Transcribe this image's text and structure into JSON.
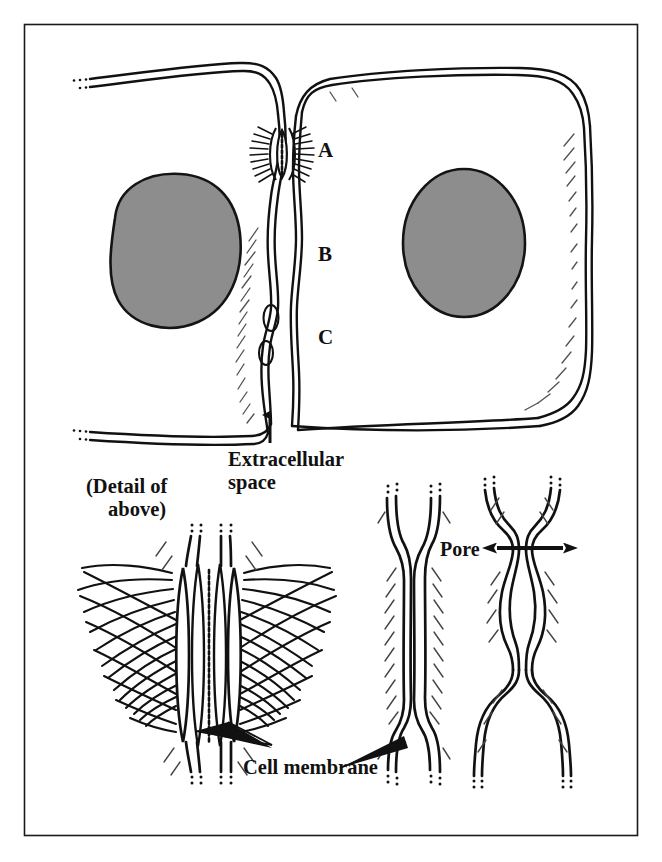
{
  "figure": {
    "frame_color": "#1a1a1a",
    "background_color": "#ffffff",
    "ink_color": "#111111",
    "nucleus_fill": "#8d8d8d",
    "nucleus_stroke": "#141414"
  },
  "labels": {
    "junction_a": "A",
    "junction_b": "B",
    "junction_c": "C",
    "extracellular_line1": "Extracellular",
    "extracellular_line2": "space",
    "detail_line1": "(Detail of",
    "detail_line2": "above)",
    "pore": "Pore",
    "cell_membrane": "Cell membrane"
  },
  "panels": {
    "top": {
      "name": "two-adjacent-cells-overview",
      "left_cell": "left cell with gray nucleus",
      "right_cell": "right cell with gray oval nucleus",
      "junction_labels": [
        "A",
        "B",
        "C"
      ]
    },
    "detail_left": {
      "name": "desmosome-detail",
      "corresponds_to": "A",
      "caption": "(Detail of above)"
    },
    "detail_middle": {
      "name": "tight-junction-detail",
      "corresponds_to": "B"
    },
    "detail_right": {
      "name": "gap-junction-detail",
      "corresponds_to": "C",
      "annotation": "Pore"
    }
  }
}
